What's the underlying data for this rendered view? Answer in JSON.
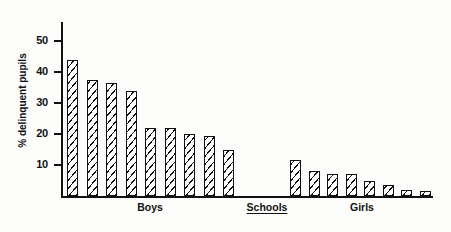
{
  "chart_data": {
    "type": "bar",
    "title": "",
    "subtitle": "",
    "xlabel": "Schools",
    "ylabel": "% delinquent pupils",
    "ylim": [
      0,
      55
    ],
    "yticks": [
      10,
      20,
      30,
      40,
      50
    ],
    "ytick_labels": [
      "10",
      "20",
      "30",
      "40",
      "50"
    ],
    "grid": false,
    "legend": "none",
    "axis_style": "left-and-bottom-spines-only",
    "bar_fill": "diagonal-hatch",
    "group_labels": [
      {
        "id": "boys",
        "label": "Boys",
        "underlined": false
      },
      {
        "id": "schools",
        "label": "Schools",
        "underlined": true
      },
      {
        "id": "girls",
        "label": "Girls",
        "underlined": false
      }
    ],
    "groups": [
      {
        "name": "Boys",
        "categories": [
          "1",
          "2",
          "3",
          "4",
          "5",
          "6",
          "7",
          "8",
          "9"
        ],
        "values": [
          44,
          37.5,
          36.5,
          34,
          22,
          22,
          20,
          19.5,
          15
        ]
      },
      {
        "name": "Girls",
        "categories": [
          "1",
          "2",
          "3",
          "4",
          "5",
          "6",
          "7",
          "8"
        ],
        "values": [
          11.5,
          8,
          7,
          7,
          5,
          3.5,
          2,
          1.5
        ]
      }
    ],
    "colors": {
      "ink": "#111111",
      "paper": "#fdfdfb"
    }
  }
}
